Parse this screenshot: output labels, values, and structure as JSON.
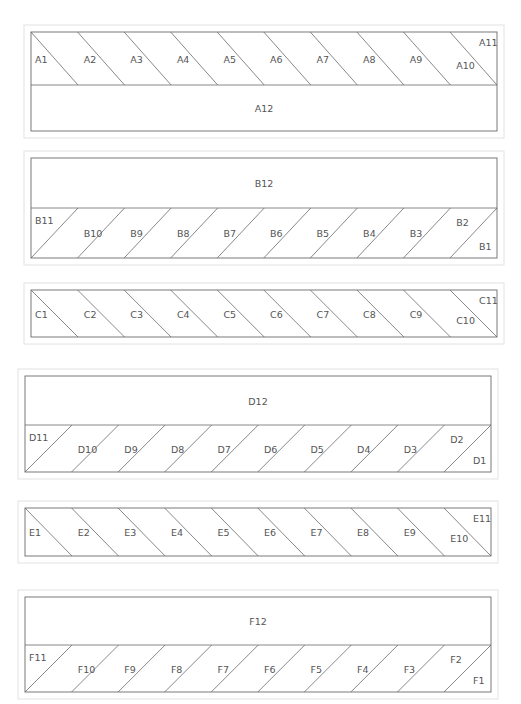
{
  "diagram": {
    "blocks": [
      {
        "id": "A",
        "layout": "strip-top",
        "slant": "backslash",
        "x0": 31,
        "x1": 497,
        "top": 32,
        "divider": 85,
        "bottom": 131,
        "big_label": "A12",
        "cell_labels": [
          "A1",
          "A2",
          "A3",
          "A4",
          "A5",
          "A6",
          "A7",
          "A8",
          "A9",
          "A10",
          "A11"
        ]
      },
      {
        "id": "B",
        "layout": "strip-bottom",
        "slant": "slash",
        "x0": 31,
        "x1": 497,
        "top": 158,
        "divider": 208,
        "bottom": 258,
        "big_label": "B12",
        "cell_labels": [
          "B11",
          "B10",
          "B9",
          "B8",
          "B7",
          "B6",
          "B5",
          "B4",
          "B3",
          "B2",
          "B1"
        ]
      },
      {
        "id": "C",
        "layout": "strip-only",
        "slant": "backslash",
        "x0": 31,
        "x1": 497,
        "top": 290,
        "bottom": 337,
        "cell_labels": [
          "C1",
          "C2",
          "C3",
          "C4",
          "C5",
          "C6",
          "C7",
          "C8",
          "C9",
          "C10",
          "C11"
        ]
      },
      {
        "id": "D",
        "layout": "strip-bottom",
        "slant": "slash",
        "x0": 25,
        "x1": 491,
        "top": 376,
        "divider": 425,
        "bottom": 472,
        "big_label": "D12",
        "cell_labels": [
          "D11",
          "D10",
          "D9",
          "D8",
          "D7",
          "D6",
          "D5",
          "D4",
          "D3",
          "D2",
          "D1"
        ]
      },
      {
        "id": "E",
        "layout": "strip-only",
        "slant": "backslash",
        "x0": 25,
        "x1": 491,
        "top": 508,
        "bottom": 556,
        "cell_labels": [
          "E1",
          "E2",
          "E3",
          "E4",
          "E5",
          "E6",
          "E7",
          "E8",
          "E9",
          "E10",
          "E11"
        ]
      },
      {
        "id": "F",
        "layout": "strip-bottom",
        "slant": "slash",
        "x0": 25,
        "x1": 491,
        "top": 597,
        "divider": 645,
        "bottom": 692,
        "big_label": "F12",
        "cell_labels": [
          "F11",
          "F10",
          "F9",
          "F8",
          "F7",
          "F6",
          "F5",
          "F4",
          "F3",
          "F2",
          "F1"
        ]
      }
    ]
  }
}
